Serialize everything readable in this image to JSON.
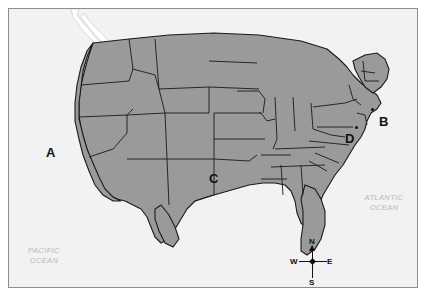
{
  "figure": {
    "kind": "reference-map",
    "region": "Contiguous United States",
    "land_color": "#9a9a9a",
    "water_color": "#f2f2f2",
    "border_color": "#1a1a1a",
    "frame_color": "#8d8d8d",
    "page_color": "#ffffff"
  },
  "markers": [
    {
      "letter": "A",
      "x": 45,
      "y": 145,
      "has_dot": false,
      "dot_x": 0,
      "dot_y": 0
    },
    {
      "letter": "B",
      "x": 378,
      "y": 114,
      "has_dot": true,
      "dot_x": 370,
      "dot_y": 107
    },
    {
      "letter": "C",
      "x": 208,
      "y": 171,
      "has_dot": false,
      "dot_x": 0,
      "dot_y": 0
    },
    {
      "letter": "D",
      "x": 344,
      "y": 131,
      "has_dot": true,
      "dot_x": 354,
      "dot_y": 125
    }
  ],
  "ocean_labels": [
    {
      "name": "pacific-ocean-label",
      "text": "PACIFIC\nOCEAN",
      "x": 14,
      "y": 245,
      "width": 58
    },
    {
      "name": "atlantic-ocean-label",
      "text": "ATLANTIC\nOCEAN",
      "x": 352,
      "y": 192,
      "width": 62
    }
  ],
  "compass": {
    "north": "N",
    "east": "E",
    "south": "S",
    "west": "W"
  }
}
